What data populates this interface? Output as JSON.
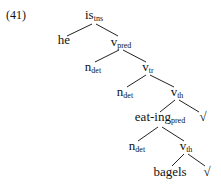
{
  "example_number": "(41)",
  "tree": {
    "nodes": [
      {
        "id": "n0",
        "base": "is",
        "sub": "tns",
        "x": 94,
        "y": 8
      },
      {
        "id": "n1",
        "base": "he",
        "sub": "",
        "x": 64,
        "y": 33
      },
      {
        "id": "n2",
        "base": "v",
        "sub": "pred",
        "x": 121,
        "y": 35
      },
      {
        "id": "n3",
        "base": "n",
        "sub": "det",
        "x": 93,
        "y": 60
      },
      {
        "id": "n4",
        "base": "v",
        "sub": "tr",
        "x": 148,
        "y": 60
      },
      {
        "id": "n5",
        "base": "n",
        "sub": "det",
        "x": 125,
        "y": 85
      },
      {
        "id": "n6",
        "base": "v",
        "sub": "th",
        "x": 177,
        "y": 85
      },
      {
        "id": "n7",
        "base": "eat-ing",
        "sub": "pred",
        "x": 160,
        "y": 110
      },
      {
        "id": "n8",
        "base": "√",
        "sub": "",
        "x": 203,
        "y": 110
      },
      {
        "id": "n9",
        "base": "n",
        "sub": "det",
        "x": 137,
        "y": 139
      },
      {
        "id": "n10",
        "base": "v",
        "sub": "th",
        "x": 186,
        "y": 139
      },
      {
        "id": "n11",
        "base": "bagels",
        "sub": "",
        "x": 170,
        "y": 165
      },
      {
        "id": "n12",
        "base": "√",
        "sub": "",
        "x": 207,
        "y": 165
      }
    ],
    "edges": [
      {
        "from": "n0",
        "to": "n1",
        "x1": 92,
        "y1": 24,
        "x2": 67,
        "y2": 36
      },
      {
        "from": "n0",
        "to": "n2",
        "x1": 96,
        "y1": 24,
        "x2": 118,
        "y2": 36
      },
      {
        "from": "n2",
        "to": "n3",
        "x1": 119,
        "y1": 50,
        "x2": 95,
        "y2": 62
      },
      {
        "from": "n2",
        "to": "n4",
        "x1": 123,
        "y1": 50,
        "x2": 146,
        "y2": 62
      },
      {
        "from": "n4",
        "to": "n5",
        "x1": 146,
        "y1": 75,
        "x2": 127,
        "y2": 87
      },
      {
        "from": "n4",
        "to": "n6",
        "x1": 150,
        "y1": 75,
        "x2": 174,
        "y2": 87
      },
      {
        "from": "n6",
        "to": "n7",
        "x1": 175,
        "y1": 100,
        "x2": 160,
        "y2": 112
      },
      {
        "from": "n6",
        "to": "n8",
        "x1": 179,
        "y1": 100,
        "x2": 199,
        "y2": 112
      },
      {
        "from": "n7",
        "to": "n9",
        "x1": 158,
        "y1": 127,
        "x2": 138,
        "y2": 141
      },
      {
        "from": "n7",
        "to": "n10",
        "x1": 162,
        "y1": 127,
        "x2": 184,
        "y2": 141
      },
      {
        "from": "n10",
        "to": "n11",
        "x1": 184,
        "y1": 154,
        "x2": 172,
        "y2": 166
      },
      {
        "from": "n10",
        "to": "n12",
        "x1": 188,
        "y1": 154,
        "x2": 205,
        "y2": 166
      }
    ]
  }
}
